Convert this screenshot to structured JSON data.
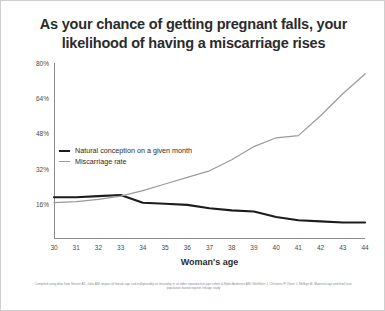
{
  "title": "As your chance of getting pregnant falls, your likelihood of having a miscarriage rises",
  "footnote": "Compiled using data from Steiner AZ, Jukic AM. Impact of female age and nulligravidity on fecundity in an older reproductive age cohort & Nybo Andersen AM, Wohlfahrt J, Christens P, Olsen J, Melbye M. Maternal age and fetal loss: population based register linkage study",
  "colors": {
    "conception_line": "#1c1c1c",
    "miscarriage_line": "#9a9a9a",
    "axis": "#8a8a8a",
    "text": "#2b2b2b",
    "tick_text": "#4a4a4a",
    "footnote_text": "#8d8d8d",
    "frame": "#cfcfcf",
    "background": "#ffffff"
  },
  "legend": {
    "position": "inside-left",
    "entries": [
      {
        "label": "Natural conception on a given month",
        "color": "#1c1c1c",
        "style": "thick"
      },
      {
        "label": "Miscarriage rate",
        "color": "#9a9a9a",
        "style": "thin"
      }
    ]
  },
  "chart_data": {
    "type": "line",
    "title": "As your chance of getting pregnant falls, your likelihood of having a miscarriage rises",
    "xlabel": "Woman's age",
    "ylabel": "",
    "x": [
      30,
      31,
      32,
      33,
      34,
      35,
      36,
      37,
      38,
      39,
      40,
      41,
      42,
      43,
      44
    ],
    "xlim": [
      30,
      44
    ],
    "ylim": [
      0,
      80
    ],
    "yticks": [
      16,
      32,
      48,
      64,
      80
    ],
    "ytick_labels": [
      "16%",
      "32%",
      "48%",
      "64%",
      "80%"
    ],
    "xtick_labels": [
      "30",
      "31",
      "32",
      "33",
      "34",
      "35",
      "36",
      "37",
      "38",
      "39",
      "40",
      "41",
      "42",
      "43",
      "44"
    ],
    "grid": false,
    "series": [
      {
        "name": "Natural conception on a given month",
        "color": "#1c1c1c",
        "values": [
          19,
          19,
          19.5,
          20,
          16.5,
          16,
          15.5,
          14,
          13,
          12.5,
          10,
          8.5,
          8,
          7.5,
          7.5
        ]
      },
      {
        "name": "Miscarriage rate",
        "color": "#9a9a9a",
        "values": [
          16.5,
          17,
          18,
          19.5,
          22,
          25,
          28,
          31,
          36,
          42,
          46,
          47,
          56,
          66,
          75
        ]
      }
    ]
  }
}
